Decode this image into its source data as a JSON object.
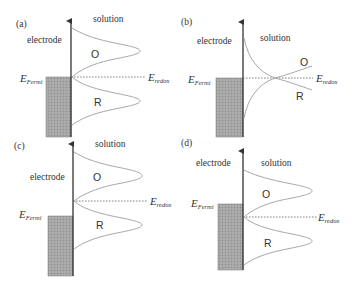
{
  "panels": [
    {
      "id": "a",
      "tag": "(a)",
      "electrode_label": "electrode",
      "solution_label": "solution",
      "oxidized_label": "O",
      "reduced_label": "R",
      "fermi_label": "E",
      "fermi_sub": "Fermi",
      "redox_label": "E",
      "redox_sub": "redox",
      "description": "Fermi level aligned with E_redox"
    },
    {
      "id": "b",
      "tag": "(b)",
      "electrode_label": "electrode",
      "solution_label": "solution",
      "oxidized_label": "O",
      "reduced_label": "R",
      "fermi_label": "E",
      "fermi_sub": "Fermi",
      "redox_label": "E",
      "redox_sub": "redox",
      "description": "Distributions crossing at E_redox"
    },
    {
      "id": "c",
      "tag": "(c)",
      "electrode_label": "electrode",
      "solution_label": "solution",
      "oxidized_label": "O",
      "reduced_label": "R",
      "fermi_label": "E",
      "fermi_sub": "Fermi",
      "redox_label": "E",
      "redox_sub": "redox",
      "description": "Fermi level below E_redox"
    },
    {
      "id": "d",
      "tag": "(d)",
      "electrode_label": "electrode",
      "solution_label": "solution",
      "oxidized_label": "O",
      "reduced_label": "R",
      "fermi_label": "E",
      "fermi_sub": "Fermi",
      "redox_label": "E",
      "redox_sub": "redox",
      "description": "Fermi level above E_redox"
    }
  ],
  "colors": {
    "electrode_fill": "#a0a0a0",
    "curve": "#a8a8a8",
    "axis": "#333333",
    "text": "#333333"
  }
}
